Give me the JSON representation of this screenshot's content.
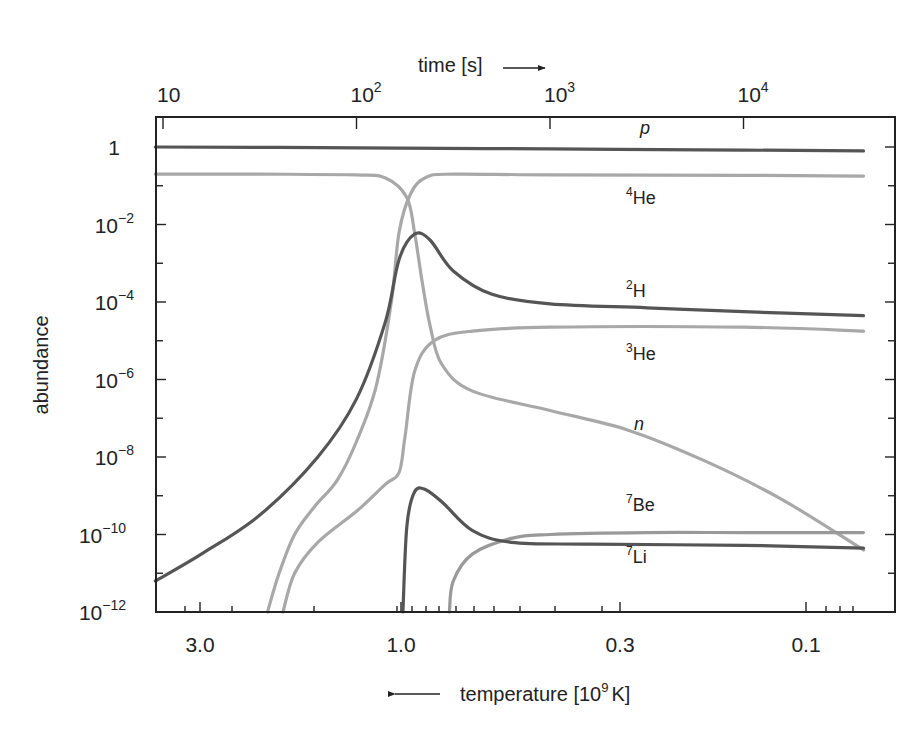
{
  "chart_data": {
    "type": "line",
    "title": "",
    "xlabel_top": "time [s]",
    "xlabel_bottom": "temperature [10^9 K]",
    "ylabel": "abundance",
    "x_scale": "log",
    "y_scale": "log",
    "xlim_time_s": [
      8.5,
      40000
    ],
    "ylim": [
      1e-12,
      10
    ],
    "top_ticks": [
      {
        "label": "10",
        "exp": "",
        "value": 10
      },
      {
        "label": "10",
        "exp": "2",
        "value": 100
      },
      {
        "label": "10",
        "exp": "3",
        "value": 1000
      },
      {
        "label": "10",
        "exp": "4",
        "value": 10000
      }
    ],
    "bottom_ticks": [
      {
        "label": "3.0",
        "value": 3.0
      },
      {
        "label": "1.0",
        "value": 1.0
      },
      {
        "label": "0.3",
        "value": 0.3
      },
      {
        "label": "0.1",
        "value": 0.1
      }
    ],
    "y_ticks": [
      {
        "label": "1",
        "exp": "",
        "value": 1
      },
      {
        "label": "10",
        "exp": "−2",
        "value": 0.01
      },
      {
        "label": "10",
        "exp": "−4",
        "value": 0.0001
      },
      {
        "label": "10",
        "exp": "−6",
        "value": 1e-06
      },
      {
        "label": "10",
        "exp": "−8",
        "value": 1e-08
      },
      {
        "label": "10",
        "exp": "−10",
        "value": 1e-10
      },
      {
        "label": "10",
        "exp": "−12",
        "value": 1e-12
      }
    ],
    "grid": false,
    "legend": "inline labels",
    "series_note": "points given as [log10(time s), log10(abundance)]",
    "series": [
      {
        "name": "p",
        "label": "p",
        "italic": true,
        "sup": "",
        "color": "#555555",
        "points": [
          [
            0.96,
            0.0
          ],
          [
            2.0,
            -0.02
          ],
          [
            3.0,
            -0.05
          ],
          [
            4.0,
            -0.08
          ],
          [
            4.62,
            -0.1
          ]
        ]
      },
      {
        "name": "4He",
        "label": "He",
        "sup": "4",
        "color": "#a8a8a8",
        "points": [
          [
            0.96,
            -0.7
          ],
          [
            1.5,
            -0.7
          ],
          [
            2.0,
            -0.72
          ],
          [
            2.15,
            -0.8
          ],
          [
            2.26,
            -1.3
          ],
          [
            2.3,
            -2.2
          ],
          [
            2.34,
            -3.5
          ],
          [
            2.38,
            -4.6
          ],
          [
            2.44,
            -5.6
          ],
          [
            2.6,
            -6.3
          ],
          [
            3.0,
            -6.8
          ],
          [
            3.4,
            -7.3
          ],
          [
            3.8,
            -8.1
          ],
          [
            4.2,
            -9.1
          ],
          [
            4.62,
            -10.4
          ]
        ],
        "note": "this path is the neutron (n) fraction"
      },
      {
        "name": "n",
        "label": "n",
        "italic": true,
        "sup": "",
        "color": "#a8a8a8",
        "points": [
          [
            1.54,
            -12.0
          ],
          [
            1.6,
            -11.0
          ],
          [
            1.68,
            -10.0
          ],
          [
            1.78,
            -9.3
          ],
          [
            1.9,
            -8.6
          ],
          [
            2.0,
            -7.6
          ],
          [
            2.1,
            -6.2
          ],
          [
            2.18,
            -4.0
          ],
          [
            2.22,
            -2.2
          ],
          [
            2.28,
            -1.2
          ],
          [
            2.36,
            -0.78
          ],
          [
            2.5,
            -0.7
          ],
          [
            3.0,
            -0.72
          ],
          [
            4.0,
            -0.73
          ],
          [
            4.62,
            -0.75
          ]
        ],
        "note": "this path is the 4He fraction"
      },
      {
        "name": "2H",
        "label": "H",
        "sup": "2",
        "color": "#555555",
        "points": [
          [
            0.96,
            -11.2
          ],
          [
            1.2,
            -10.5
          ],
          [
            1.5,
            -9.5
          ],
          [
            1.8,
            -8.0
          ],
          [
            2.0,
            -6.5
          ],
          [
            2.15,
            -4.5
          ],
          [
            2.22,
            -2.9
          ],
          [
            2.3,
            -2.25
          ],
          [
            2.38,
            -2.4
          ],
          [
            2.5,
            -3.2
          ],
          [
            2.7,
            -3.8
          ],
          [
            3.0,
            -4.05
          ],
          [
            3.5,
            -4.15
          ],
          [
            4.0,
            -4.25
          ],
          [
            4.62,
            -4.35
          ]
        ]
      },
      {
        "name": "3He",
        "label": "He",
        "sup": "3",
        "color": "#a8a8a8",
        "points": [
          [
            1.62,
            -12.0
          ],
          [
            1.68,
            -11.0
          ],
          [
            1.8,
            -10.2
          ],
          [
            2.0,
            -9.4
          ],
          [
            2.15,
            -8.7
          ],
          [
            2.22,
            -8.4
          ],
          [
            2.25,
            -7.5
          ],
          [
            2.3,
            -5.8
          ],
          [
            2.4,
            -5.0
          ],
          [
            2.6,
            -4.75
          ],
          [
            3.0,
            -4.65
          ],
          [
            4.0,
            -4.65
          ],
          [
            4.62,
            -4.75
          ]
        ]
      },
      {
        "name": "7Be",
        "label": "Be",
        "sup": "7",
        "color": "#999999",
        "points": [
          [
            2.48,
            -12.0
          ],
          [
            2.5,
            -11.2
          ],
          [
            2.6,
            -10.5
          ],
          [
            2.8,
            -10.1
          ],
          [
            3.0,
            -10.0
          ],
          [
            3.5,
            -9.95
          ],
          [
            4.0,
            -9.95
          ],
          [
            4.62,
            -9.95
          ]
        ]
      },
      {
        "name": "7Li",
        "label": "Li",
        "sup": "7",
        "color": "#555555",
        "points": [
          [
            2.24,
            -12.0
          ],
          [
            2.26,
            -9.8
          ],
          [
            2.3,
            -8.9
          ],
          [
            2.36,
            -8.85
          ],
          [
            2.45,
            -9.2
          ],
          [
            2.6,
            -9.9
          ],
          [
            2.8,
            -10.2
          ],
          [
            3.2,
            -10.25
          ],
          [
            4.0,
            -10.28
          ],
          [
            4.62,
            -10.35
          ]
        ]
      }
    ],
    "annotations": [
      {
        "text": "p",
        "italic": true,
        "x_px": 640,
        "y_px": 134
      },
      {
        "text": "He",
        "sup": "4",
        "x_px": 626,
        "y_px": 204
      },
      {
        "text": "H",
        "sup": "2",
        "x_px": 626,
        "y_px": 297
      },
      {
        "text": "He",
        "sup": "3",
        "x_px": 626,
        "y_px": 360
      },
      {
        "text": "n",
        "italic": true,
        "x_px": 634,
        "y_px": 430
      },
      {
        "text": "Be",
        "sup": "7",
        "x_px": 626,
        "y_px": 511
      },
      {
        "text": "Li",
        "sup": "7",
        "x_px": 626,
        "y_px": 563
      }
    ]
  }
}
